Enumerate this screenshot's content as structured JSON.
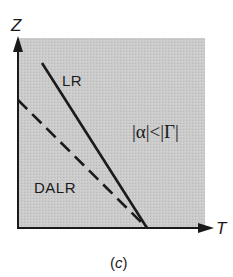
{
  "diagram": {
    "panel_caption_open": "(",
    "panel_caption_letter": "c",
    "panel_caption_close": ")",
    "background_color": "#ffffff",
    "region_fill_color": "#c9c9c9",
    "line_color": "#1a1a1a",
    "axes": {
      "x": {
        "label": "T"
      },
      "y": {
        "label": "Z"
      }
    },
    "lines": [
      {
        "name": "LR",
        "label": "LR",
        "style": "solid"
      },
      {
        "name": "DALR",
        "label": "DALR",
        "style": "dashed"
      }
    ],
    "region_label": "|α|<|Γ|"
  }
}
